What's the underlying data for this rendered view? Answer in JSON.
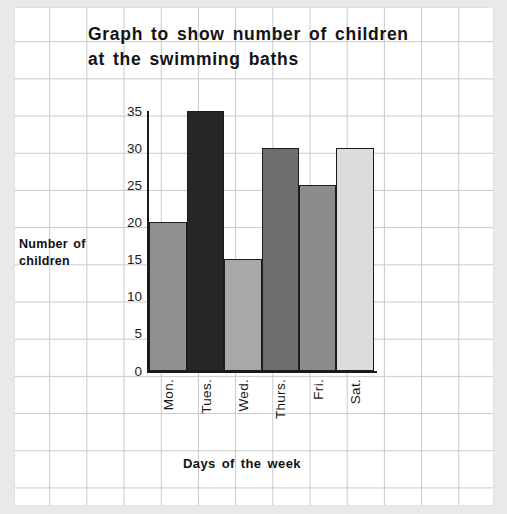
{
  "chart_data": {
    "type": "bar",
    "title": "Graph to show number of children at the swimming baths",
    "title_lines": [
      "Graph to show number of children",
      "at the swimming baths"
    ],
    "xlabel": "Days of the week",
    "ylabel": "Number of children",
    "ylabel_lines": [
      "Number of",
      "children"
    ],
    "categories": [
      "Mon.",
      "Tues.",
      "Wed.",
      "Thurs.",
      "Fri.",
      "Sat."
    ],
    "values": [
      20,
      35,
      15,
      30,
      25,
      30
    ],
    "bar_colors": [
      "#909090",
      "#262626",
      "#a8a8a8",
      "#6e6e6e",
      "#8c8c8c",
      "#dcdcdc"
    ],
    "ylim": [
      0,
      35
    ],
    "yticks": [
      0,
      5,
      10,
      15,
      20,
      25,
      30,
      35
    ],
    "ytick_labels": [
      "0",
      "5",
      "10",
      "15",
      "20",
      "25",
      "30",
      "35"
    ],
    "grid": true,
    "legend": false,
    "background": "graph-paper"
  },
  "colors": {
    "axis": "#1a1a1a",
    "grid": "#c9c9c9",
    "page": "#ffffff",
    "margin": "#e9e9e9",
    "text": "#111111"
  }
}
